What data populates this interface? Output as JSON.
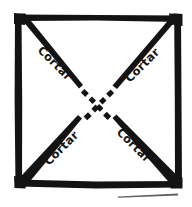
{
  "figure": {
    "ink_color": "#131313",
    "background_color": "#ffffff",
    "stroke_style": "hand-drawn",
    "shape": {
      "name": "square",
      "sides": 4,
      "left": 16,
      "top": 15,
      "right": 180,
      "bottom": 186
    },
    "diagonals": [
      {
        "name": "diagonal-top-left-to-bottom-right",
        "from": "top-left-corner",
        "to": "bottom-right-corner",
        "center_style": "dashed"
      },
      {
        "name": "diagonal-top-right-to-bottom-left",
        "from": "top-right-corner",
        "to": "bottom-left-corner",
        "center_style": "dashed"
      }
    ],
    "labels": [
      {
        "id": "top-left",
        "text": "Cortar",
        "x": 52,
        "y": 66,
        "rotation": 45
      },
      {
        "id": "top-right",
        "text": "Cortar",
        "x": 145,
        "y": 68,
        "rotation": -45
      },
      {
        "id": "bottom-left",
        "text": "Cortar",
        "x": 64,
        "y": 151,
        "rotation": -45
      },
      {
        "id": "bottom-right",
        "text": "Cortar",
        "x": 131,
        "y": 148,
        "rotation": 45
      }
    ]
  }
}
